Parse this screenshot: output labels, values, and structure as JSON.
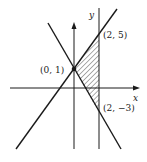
{
  "diagram": {
    "type": "coordinate-plane-region",
    "axes": {
      "x_label": "x",
      "y_label": "y"
    },
    "lines": [
      {
        "name": "line-increasing",
        "equation": "y = 2x + 1"
      },
      {
        "name": "line-decreasing",
        "equation": "y = -2x + 1"
      },
      {
        "name": "vertical-line",
        "equation": "x = 2"
      }
    ],
    "points": [
      {
        "label": "(0, 1)",
        "x": 0,
        "y": 1
      },
      {
        "label": "(2, 5)",
        "x": 2,
        "y": 5
      },
      {
        "label": "(2, −3)",
        "x": 2,
        "y": -3
      }
    ],
    "shaded_region": {
      "vertices": [
        "(0, 1)",
        "(2, 5)",
        "(2, −3)"
      ],
      "fill": "hatched"
    },
    "colors": {
      "ink": "#1a1a1a",
      "background": "#ffffff"
    }
  }
}
